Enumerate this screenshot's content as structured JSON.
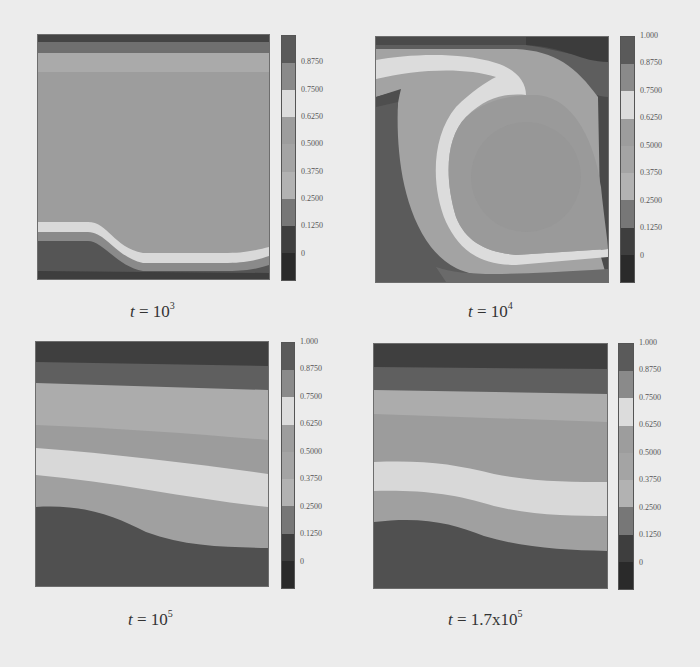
{
  "chart_data": [
    {
      "type": "heatmap",
      "title": "t = 10^3",
      "caption": {
        "prefix": "t = ",
        "base": "10",
        "exponent": "3"
      },
      "description": "Filled contour plot: mostly uniform mid-level field (0.375–0.5), thin dark band at top, light thin band near bottom dipping down from left to right, dark region at bottom-left",
      "colorbar_ticks": [
        "0.8750",
        "0.7500",
        "0.6250",
        "0.5000",
        "0.3750",
        "0.2500",
        "0.1250",
        "0"
      ],
      "levels": [
        0,
        0.125,
        0.25,
        0.375,
        0.5,
        0.625,
        0.75,
        0.875,
        1.0
      ],
      "xlabel": "",
      "ylabel": ""
    },
    {
      "type": "heatmap",
      "title": "t = 10^4",
      "caption": {
        "prefix": "t = ",
        "base": "10",
        "exponent": "4"
      },
      "description": "Filled contour plot: large circular convection cell, light band curling from top-left around to bottom, dark region left and top-right",
      "colorbar_ticks": [
        "1.000",
        "0.8750",
        "0.7500",
        "0.6250",
        "0.5000",
        "0.3750",
        "0.2500",
        "0.1250",
        "0"
      ],
      "levels": [
        0,
        0.125,
        0.25,
        0.375,
        0.5,
        0.625,
        0.75,
        0.875,
        1.0
      ],
      "xlabel": "",
      "ylabel": ""
    },
    {
      "type": "heatmap",
      "title": "t = 10^5",
      "caption": {
        "prefix": "t = ",
        "base": "10",
        "exponent": "5"
      },
      "description": "Filled contour plot: near-horizontal stratified layers sloping slightly downward to the right, dark at top and bottom, light band in middle",
      "colorbar_ticks": [
        "1.000",
        "0.8750",
        "0.7500",
        "0.6250",
        "0.5000",
        "0.3750",
        "0.2500",
        "0.1250",
        "0"
      ],
      "levels": [
        0,
        0.125,
        0.25,
        0.375,
        0.5,
        0.625,
        0.75,
        0.875,
        1.0
      ],
      "xlabel": "",
      "ylabel": ""
    },
    {
      "type": "heatmap",
      "title": "t = 1.7x10^5",
      "caption": {
        "prefix": "t = ",
        "base": "1.7x10",
        "exponent": "5"
      },
      "description": "Filled contour plot: stratified layers with slight S-curve sloping downward to the right, very similar to t = 10^5",
      "colorbar_ticks": [
        "1.000",
        "0.8750",
        "0.7500",
        "0.6250",
        "0.5000",
        "0.3750",
        "0.2500",
        "0.1250",
        "0"
      ],
      "levels": [
        0,
        0.125,
        0.25,
        0.375,
        0.5,
        0.625,
        0.75,
        0.875,
        1.0
      ],
      "xlabel": "",
      "ylabel": ""
    }
  ],
  "colorbar_colors": [
    "#5a5a5a",
    "#8a8a8a",
    "#dcdcdc",
    "#9d9d9d",
    "#a4a4a4",
    "#b2b2b2",
    "#777777",
    "#3e3e3e",
    "#2a2a2a"
  ],
  "band_colors": {
    "darkest": "#3a3a3a",
    "dark": "#555555",
    "mid_dark": "#7a7a7a",
    "mid": "#9c9c9c",
    "mid_light": "#adadad",
    "light": "#d8d8d8"
  }
}
